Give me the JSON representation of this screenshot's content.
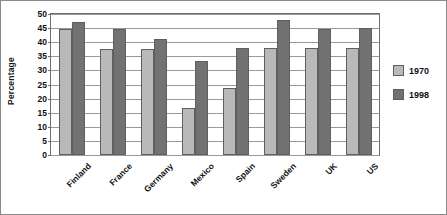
{
  "chart_data": {
    "type": "bar",
    "title": "",
    "xlabel": "",
    "ylabel": "Percentage",
    "ylim": [
      0,
      50
    ],
    "ytick_step": 5,
    "yticks": [
      0,
      5,
      10,
      15,
      20,
      25,
      30,
      35,
      40,
      45,
      50
    ],
    "grid": true,
    "legend_position": "right",
    "categories": [
      "Finland",
      "France",
      "Germany",
      "Mexico",
      "Spain",
      "Sweden",
      "UK",
      "US"
    ],
    "series": [
      {
        "name": "1970",
        "color": "#b9b9b9",
        "values": [
          44.8,
          37.5,
          37.5,
          16.8,
          23.8,
          37.8,
          37.8,
          37.8
        ]
      },
      {
        "name": "1998",
        "color": "#727272",
        "values": [
          47.2,
          44.8,
          41.2,
          33.5,
          38.0,
          48.0,
          44.8,
          45.0
        ]
      }
    ]
  },
  "legend": {
    "items": [
      {
        "label": "1970",
        "swatch": "s1970"
      },
      {
        "label": "1998",
        "swatch": "s1998"
      }
    ]
  }
}
